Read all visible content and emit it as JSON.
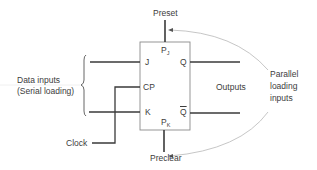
{
  "diagram": {
    "type": "JK flip-flop block diagram",
    "block": {
      "pins": {
        "preset_pin": {
          "main": "P",
          "sub": "J"
        },
        "preclear_pin": {
          "main": "P",
          "sub": "K"
        },
        "j": "J",
        "cp": "CP",
        "k": "K",
        "q": "Q",
        "q_bar": "Q"
      }
    },
    "labels": {
      "preset": "Preset",
      "preclear": "Preclear",
      "data_inputs_line1": "Data inputs",
      "data_inputs_line2": "(Serial loading)",
      "clock": "Clock",
      "outputs": "Outputs",
      "parallel_line1": "Parallel",
      "parallel_line2": "loading",
      "parallel_line3": "inputs"
    },
    "colors": {
      "line": "#3a3a3a",
      "box": "#8a8a8a",
      "arrow": "#b8b8b8",
      "background": "#ffffff"
    }
  }
}
